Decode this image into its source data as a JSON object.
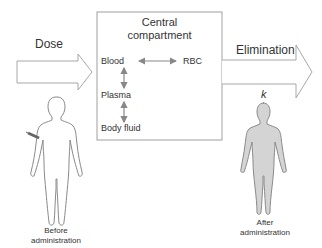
{
  "diagram": {
    "arrows": {
      "dose_label": "Dose",
      "elimination_label": "Elimination",
      "rate_constant": "k"
    },
    "central_compartment": {
      "title_line1": "Central",
      "title_line2": "compartment",
      "nodes": [
        "Blood",
        "RBC",
        "Plasma",
        "Body fluid"
      ],
      "links": [
        {
          "from": "Blood",
          "to": "RBC",
          "type": "bidirectional"
        },
        {
          "from": "Blood",
          "to": "Plasma",
          "type": "bidirectional"
        },
        {
          "from": "Plasma",
          "to": "Body fluid",
          "type": "bidirectional"
        }
      ]
    },
    "figures": {
      "before": {
        "line1": "Before",
        "line2": "administration"
      },
      "after": {
        "line1": "After",
        "line2": "administration"
      }
    },
    "colors": {
      "outline": "#9a9a9a",
      "arrow_fill": "#ffffff",
      "after_body_fill": "#d4d4d4",
      "link_arrow": "#888888"
    }
  }
}
